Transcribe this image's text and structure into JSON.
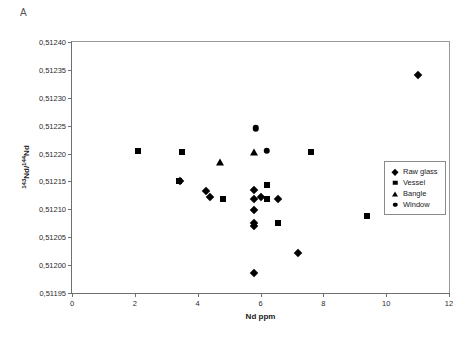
{
  "panel": {
    "label": "A"
  },
  "chart_data": {
    "type": "scatter",
    "title": "",
    "xlabel": "Nd ppm",
    "ylabel": "143Nd/144Nd",
    "ylabel_num": "143",
    "ylabel_den": "144",
    "xlim": [
      0,
      12
    ],
    "ylim": [
      0.51195,
      0.5124
    ],
    "xticks": [
      "0",
      "2",
      "4",
      "6",
      "8",
      "10",
      "12"
    ],
    "xtick_values": [
      0,
      2,
      4,
      6,
      8,
      10,
      12
    ],
    "yticks": [
      "0,51195",
      "0,51200",
      "0,51205",
      "0,51210",
      "0,51215",
      "0,51220",
      "0,51225",
      "0,51230",
      "0,51235",
      "0,51240"
    ],
    "ytick_values": [
      0.51195,
      0.512,
      0.51205,
      0.5121,
      0.51215,
      0.5122,
      0.51225,
      0.5123,
      0.51235,
      0.5124
    ],
    "grid": false,
    "legend_position": "right",
    "marker_color": "#000000",
    "series": [
      {
        "name": "Raw glass",
        "marker": "diamond",
        "points": [
          {
            "x": 3.45,
            "y": 0.51215
          },
          {
            "x": 4.25,
            "y": 0.512132
          },
          {
            "x": 4.4,
            "y": 0.512122
          },
          {
            "x": 5.8,
            "y": 0.512135
          },
          {
            "x": 5.8,
            "y": 0.512118
          },
          {
            "x": 5.8,
            "y": 0.512098
          },
          {
            "x": 5.8,
            "y": 0.512075
          },
          {
            "x": 5.8,
            "y": 0.51207
          },
          {
            "x": 5.8,
            "y": 0.511985
          },
          {
            "x": 6.0,
            "y": 0.512122
          },
          {
            "x": 6.55,
            "y": 0.512118
          },
          {
            "x": 7.2,
            "y": 0.512022
          },
          {
            "x": 11.0,
            "y": 0.51234
          }
        ]
      },
      {
        "name": "Vessel",
        "marker": "square",
        "points": [
          {
            "x": 2.1,
            "y": 0.512205
          },
          {
            "x": 3.5,
            "y": 0.512203
          },
          {
            "x": 3.4,
            "y": 0.51215
          },
          {
            "x": 4.8,
            "y": 0.512118
          },
          {
            "x": 6.2,
            "y": 0.512143
          },
          {
            "x": 6.2,
            "y": 0.512118
          },
          {
            "x": 6.55,
            "y": 0.512075
          },
          {
            "x": 7.6,
            "y": 0.512203
          },
          {
            "x": 9.4,
            "y": 0.512088
          }
        ]
      },
      {
        "name": "Bangle",
        "marker": "triangle",
        "points": [
          {
            "x": 4.7,
            "y": 0.512185
          },
          {
            "x": 5.8,
            "y": 0.512202
          }
        ]
      },
      {
        "name": "Window",
        "marker": "circle",
        "points": [
          {
            "x": 5.85,
            "y": 0.512245
          },
          {
            "x": 6.2,
            "y": 0.512205
          }
        ]
      }
    ]
  }
}
